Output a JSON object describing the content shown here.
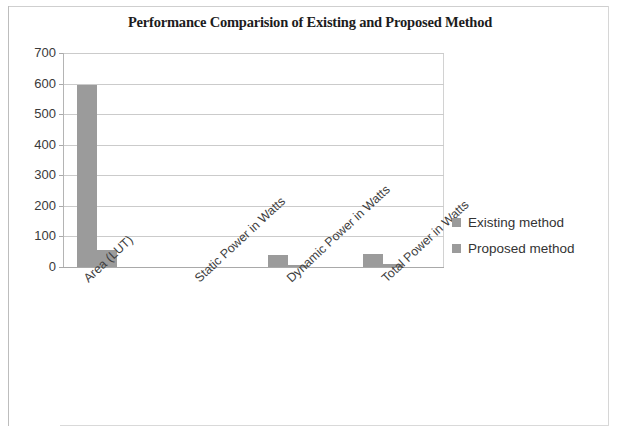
{
  "chart_data": {
    "type": "bar",
    "title": "Performance Comparision of Existing and Proposed Method",
    "xlabel": "",
    "ylabel": "",
    "ylim": [
      0,
      700
    ],
    "yticks": [
      0,
      100,
      200,
      300,
      400,
      500,
      600,
      700
    ],
    "ytick_labels": [
      "0",
      "100",
      "200",
      "300",
      "400",
      "500",
      "600",
      "700"
    ],
    "grid": true,
    "legend_position": "right",
    "categories": [
      "Area (LUT)",
      "Static Power in Watts",
      "Dynamic Power in Watts",
      "Total Power in Watts"
    ],
    "series": [
      {
        "name": "Existing method",
        "color": "#9b9b9b",
        "values": [
          595,
          0,
          40,
          42
        ]
      },
      {
        "name": "Proposed method",
        "color": "#9b9b9b",
        "values": [
          55,
          0,
          8,
          10
        ]
      }
    ]
  },
  "legend": {
    "items": [
      {
        "label": "Existing method",
        "color": "#9b9b9b"
      },
      {
        "label": "Proposed method",
        "color": "#9b9b9b"
      }
    ]
  }
}
